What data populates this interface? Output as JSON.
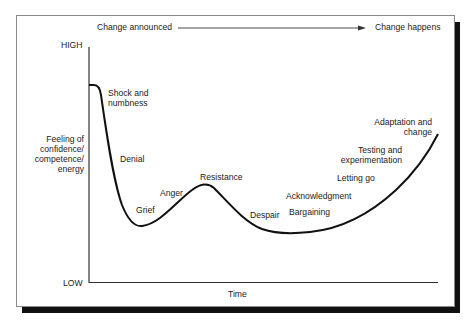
{
  "header": {
    "start_label": "Change announced",
    "end_label": "Change happens"
  },
  "axes": {
    "y_high": "HIGH",
    "y_low": "LOW",
    "y_title_lines": [
      "Feeling of",
      "confidence/",
      "competence/",
      "energy"
    ],
    "x_title": "Time"
  },
  "stages": [
    {
      "lines": [
        "Shock and",
        "numbness"
      ]
    },
    {
      "lines": [
        "Denial"
      ]
    },
    {
      "lines": [
        "Grief"
      ]
    },
    {
      "lines": [
        "Anger"
      ]
    },
    {
      "lines": [
        "Resistance"
      ]
    },
    {
      "lines": [
        "Despair"
      ]
    },
    {
      "lines": [
        "Acknowledgment"
      ]
    },
    {
      "lines": [
        "Bargaining"
      ]
    },
    {
      "lines": [
        "Letting go"
      ]
    },
    {
      "lines": [
        "Testing and",
        "experimentation"
      ]
    },
    {
      "lines": [
        "Adaptation and",
        "change"
      ]
    }
  ],
  "colors": {
    "curve": "#111111",
    "axis": "#333333",
    "frame_border": "#8a8a8a",
    "shadow": "#111111"
  }
}
